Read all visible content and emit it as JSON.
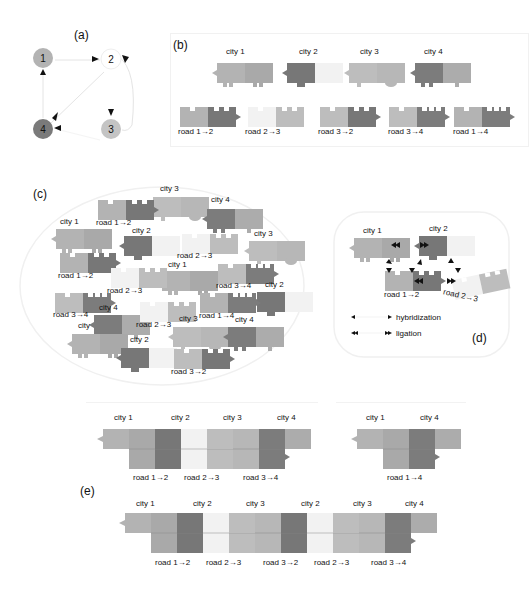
{
  "colors": {
    "city1": "#b3b3b3",
    "city1b": "#a9a9a9",
    "city2": "#777777",
    "city2b": "#f2f2f2",
    "city3": "#bdbdbd",
    "city3b": "#b7b7b7",
    "city4": "#7c7c7c",
    "city4b": "#acacac",
    "node1": "#b3b3b3",
    "node2": "#ffffff",
    "node3": "#c4c4c4",
    "node4": "#7a7a7a",
    "arrow": "#111111",
    "edge": "#e4e4e4"
  },
  "panels": {
    "a": {
      "label": "(a)",
      "nodes": [
        {
          "id": "1",
          "label": "1"
        },
        {
          "id": "2",
          "label": "2"
        },
        {
          "id": "3",
          "label": "3"
        },
        {
          "id": "4",
          "label": "4"
        }
      ],
      "edges": [
        {
          "from": "1",
          "to": "2"
        },
        {
          "from": "3",
          "to": "2"
        },
        {
          "from": "2",
          "to": "3"
        },
        {
          "from": "2",
          "to": "4"
        },
        {
          "from": "3",
          "to": "4"
        },
        {
          "from": "4",
          "to": "1"
        }
      ]
    },
    "b": {
      "label": "(b)",
      "cities": [
        "city 1",
        "city 2",
        "city 3",
        "city 4"
      ],
      "roads": [
        "road 1→2",
        "road 2→3",
        "road 3→2",
        "road 3→4",
        "road 1→4"
      ]
    },
    "c": {
      "label": "(c)",
      "items": [
        "city 3",
        "road 1→2",
        "city 4",
        "city 1",
        "city 2",
        "road 2→3",
        "city 3",
        "road 1→2",
        "city 1",
        "road 2→3",
        "road 3→4",
        "city 2",
        "city 4",
        "road 3→4",
        "city",
        "road 2→3",
        "city 3",
        "road 1→4",
        "city 4",
        "city 2",
        "road 3→2"
      ]
    },
    "d": {
      "label": "(d)",
      "city1": "city 1",
      "city2": "city 2",
      "road12": "road 1→2",
      "road23": "road 2→3",
      "legend": [
        {
          "symbol": "single-arrow",
          "text": "hybridization"
        },
        {
          "symbol": "double-arrow",
          "text": "ligation"
        }
      ]
    },
    "e": {
      "label": "(e)",
      "path1": {
        "cities": [
          "city 1",
          "city 2",
          "city 3",
          "city 4"
        ],
        "roads": [
          "road 1→2",
          "road 2→3",
          "road 3→4"
        ]
      },
      "path2": {
        "cities": [
          "city 1",
          "city 4"
        ],
        "roads": [
          "road 1→4"
        ]
      },
      "path3": {
        "cities": [
          "city 1",
          "city 2",
          "city 3",
          "city 2",
          "city 3",
          "city 4"
        ],
        "roads": [
          "road 1→2",
          "road 2→3",
          "road 3→2",
          "road 2→3",
          "road 3→4"
        ]
      }
    }
  }
}
